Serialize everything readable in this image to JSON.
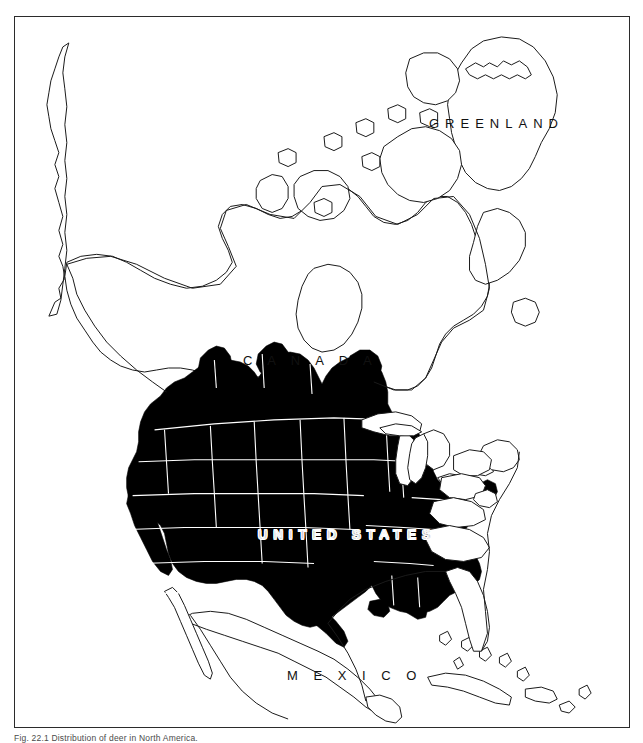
{
  "figure": {
    "caption": "Fig. 22.1  Distribution of deer in North America.",
    "frame": {
      "border_color": "#2b2b2b",
      "background_color": "#ffffff"
    }
  },
  "map": {
    "title": "Distribution map of North America",
    "projection_note": "North America, conic projection",
    "shade_color": "#000000",
    "outline_color": "#1a1a1a",
    "water_color": "#ffffff",
    "internal_border_color": "#ffffff",
    "labels": [
      {
        "id": "greenland",
        "text": "GREENLAND",
        "style": "dark"
      },
      {
        "id": "canada",
        "text": "C A N A D A",
        "style": "dark"
      },
      {
        "id": "united-states",
        "text": "UNITED STATES",
        "style": "light"
      },
      {
        "id": "mexico",
        "text": "M E X I C O",
        "style": "dark"
      }
    ],
    "legend": {
      "shaded_meaning": "Shaded (solid black) = species range / distribution",
      "unshaded_meaning": "Unshaded (white) = outside range"
    },
    "shaded_regions": [
      "Washington",
      "Oregon",
      "California",
      "Idaho",
      "Nevada",
      "Utah",
      "Arizona",
      "Montana",
      "Wyoming",
      "Colorado",
      "New Mexico",
      "North Dakota",
      "South Dakota",
      "Nebraska",
      "Kansas",
      "Oklahoma",
      "Texas",
      "Minnesota",
      "Iowa",
      "Missouri",
      "Arkansas",
      "Louisiana",
      "Wisconsin",
      "Illinois",
      "Indiana",
      "Ohio",
      "Kentucky",
      "Tennessee",
      "Mississippi",
      "Alabama",
      "Georgia",
      "southern British Columbia",
      "southern Alberta",
      "southern Saskatchewan"
    ],
    "unshaded_regions": [
      "Greenland",
      "Arctic Canada",
      "Hudson Bay region",
      "Quebec",
      "Ontario (north)",
      "Atlantic Canada",
      "Michigan",
      "Pennsylvania",
      "New York",
      "New England",
      "Virginia",
      "West Virginia",
      "North Carolina",
      "South Carolina",
      "Florida",
      "Mexico",
      "Baja California",
      "Cuba",
      "Caribbean islands",
      "Alaska"
    ]
  }
}
